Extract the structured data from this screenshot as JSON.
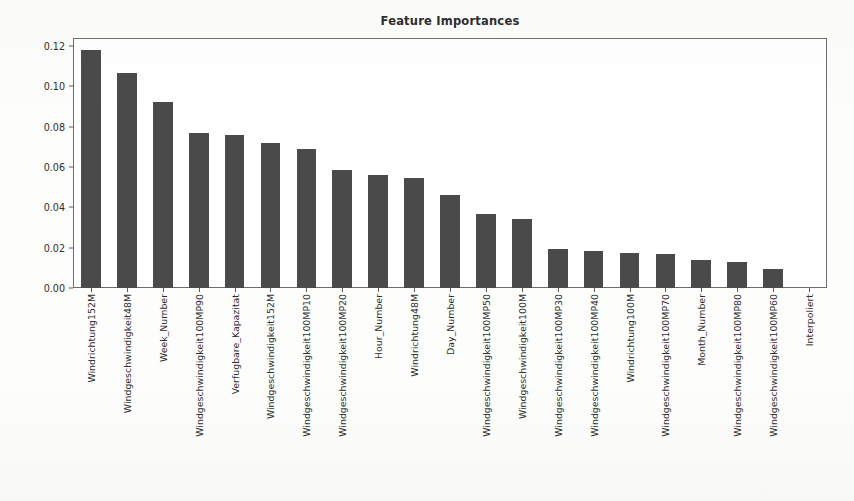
{
  "chart_data": {
    "type": "bar",
    "title": "Feature Importances",
    "xlabel": "",
    "ylabel": "Feature Importance Score",
    "ylim": [
      0.0,
      0.124
    ],
    "yticks": [
      "0.00",
      "0.02",
      "0.04",
      "0.06",
      "0.08",
      "0.10",
      "0.12"
    ],
    "ytick_values": [
      0.0,
      0.02,
      0.04,
      0.06,
      0.08,
      0.1,
      0.12
    ],
    "grid": false,
    "legend": "none",
    "bar_color": "#4a4a4a",
    "categories": [
      "Windrichtung152M",
      "Windgeschwindigkeit48M",
      "Week_Number",
      "Windgeschwindigkeit100MP90",
      "Verfugbare_Kapazitat",
      "Windgeschwindigkeit152M",
      "Windgeschwindigkeit100MP10",
      "Windgeschwindigkeit100MP20",
      "Hour_Number",
      "Windrichtung48M",
      "Day_Number",
      "Windgeschwindigkeit100MP50",
      "Windgeschwindigkeit100M",
      "Windgeschwindigkeit100MP30",
      "Windgeschwindigkeit100MP40",
      "Windrichtung100M",
      "Windgeschwindigkeit100MP70",
      "Month_Number",
      "Windgeschwindigkeit100MP80",
      "Windgeschwindigkeit100MP60",
      "Interpoliert"
    ],
    "values": [
      0.118,
      0.1065,
      0.0922,
      0.077,
      0.076,
      0.072,
      0.069,
      0.0585,
      0.0562,
      0.0545,
      0.0463,
      0.0365,
      0.034,
      0.0192,
      0.0182,
      0.0175,
      0.0168,
      0.014,
      0.0128,
      0.0092,
      0.0
    ]
  }
}
